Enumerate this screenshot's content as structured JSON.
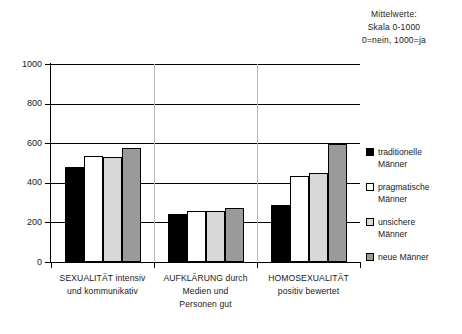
{
  "header": {
    "line1": "Mittelwerte:",
    "line2": "Skala 0-1000",
    "line3": "0=nein, 1000=ja"
  },
  "legend": {
    "items": [
      {
        "label_line1": "traditionelle",
        "label_line2": "Männer",
        "color": "#000000",
        "name": "traditionelle-maenner"
      },
      {
        "label_line1": "pragmatische",
        "label_line2": "Männer",
        "color": "#ffffff",
        "name": "pragmatische-maenner"
      },
      {
        "label_line1": "unsichere",
        "label_line2": "Männer",
        "color": "#d8d8d8",
        "name": "unsichere-maenner"
      },
      {
        "label_line1": "neue Männer",
        "label_line2": "",
        "color": "#9a9a9a",
        "name": "neue-maenner"
      }
    ]
  },
  "axis": {
    "yticks": [
      "0",
      "200",
      "400",
      "600",
      "800",
      "1000"
    ]
  },
  "categories": [
    {
      "line1": "SEXUALITÄT intensiv",
      "line2": "und kommunikativ",
      "line3": ""
    },
    {
      "line1": "AUFKLÄRUNG durch",
      "line2": "Medien und",
      "line3": "Personen gut"
    },
    {
      "line1": "HOMOSEXUALITÄT",
      "line2": "positiv bewertet",
      "line3": ""
    }
  ],
  "chart_data": {
    "type": "bar",
    "xlabel": "",
    "ylabel": "",
    "ylim": [
      0,
      1000
    ],
    "yticks": [
      0,
      200,
      400,
      600,
      800,
      1000
    ],
    "grid": true,
    "legend_position": "right",
    "categories": [
      "SEXUALITÄT intensiv und kommunikativ",
      "AUFKLÄRUNG durch Medien und Personen gut",
      "HOMOSEXUALITÄT positiv bewertet"
    ],
    "series": [
      {
        "name": "traditionelle Männer",
        "color": "#000000",
        "values": [
          480,
          240,
          290
        ]
      },
      {
        "name": "pragmatische Männer",
        "color": "#ffffff",
        "values": [
          535,
          260,
          435
        ]
      },
      {
        "name": "unsichere Männer",
        "color": "#d8d8d8",
        "values": [
          530,
          257,
          452
        ]
      },
      {
        "name": "neue Männer",
        "color": "#9a9a9a",
        "values": [
          577,
          275,
          597
        ]
      }
    ]
  }
}
